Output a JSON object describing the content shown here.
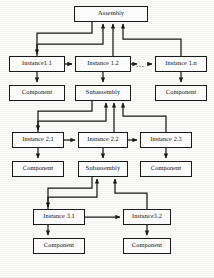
{
  "diagram": {
    "type": "block-hierarchy",
    "style": {
      "line_color": "#1a1a1a",
      "box_fill": "#ffffff",
      "text_color": "#0d0d0d",
      "background": "#fbfbfa"
    },
    "ellipsis_label": "...",
    "nodes": [
      {
        "id": "assembly",
        "label": "Assembly",
        "x": 74,
        "y": 6,
        "w": 74,
        "h": 16
      },
      {
        "id": "instance-1-1",
        "label": "Instance1.1",
        "x": 9,
        "y": 56,
        "w": 56,
        "h": 16
      },
      {
        "id": "instance-1-2",
        "label": "Instance 1.2",
        "x": 75,
        "y": 56,
        "w": 56,
        "h": 16
      },
      {
        "id": "instance-1-n",
        "label": "Instance 1.n",
        "x": 155,
        "y": 56,
        "w": 52,
        "h": 16
      },
      {
        "id": "component-1-1",
        "label": "Component",
        "x": 9,
        "y": 85,
        "w": 56,
        "h": 16
      },
      {
        "id": "subassembly-1",
        "label": "Subassembly",
        "x": 75,
        "y": 85,
        "w": 56,
        "h": 16
      },
      {
        "id": "component-1-n",
        "label": "Component",
        "x": 155,
        "y": 85,
        "w": 52,
        "h": 16
      },
      {
        "id": "instance-2-1",
        "label": "Instance 2.1",
        "x": 12,
        "y": 132,
        "w": 52,
        "h": 16
      },
      {
        "id": "instance-2-2",
        "label": "Instance 2.2",
        "x": 78,
        "y": 132,
        "w": 50,
        "h": 16
      },
      {
        "id": "instance-2-3",
        "label": "Instance 2.3",
        "x": 140,
        "y": 132,
        "w": 52,
        "h": 16
      },
      {
        "id": "component-2-1",
        "label": "Component",
        "x": 12,
        "y": 161,
        "w": 52,
        "h": 16
      },
      {
        "id": "subassembly-2",
        "label": "Subassembly",
        "x": 78,
        "y": 161,
        "w": 50,
        "h": 16
      },
      {
        "id": "component-2-3",
        "label": "Component",
        "x": 140,
        "y": 161,
        "w": 52,
        "h": 16
      },
      {
        "id": "instance-3-1",
        "label": "Instance 3.1",
        "x": 33,
        "y": 209,
        "w": 52,
        "h": 16
      },
      {
        "id": "instance-3-2",
        "label": "Instance3.2",
        "x": 123,
        "y": 209,
        "w": 48,
        "h": 16
      },
      {
        "id": "component-3-1",
        "label": "Component",
        "x": 33,
        "y": 238,
        "w": 52,
        "h": 16
      },
      {
        "id": "component-3-2",
        "label": "Component",
        "x": 123,
        "y": 238,
        "w": 48,
        "h": 16
      }
    ],
    "edges": [
      {
        "from": "assembly",
        "to": "instance-1-1",
        "kind": "elbow-down-left"
      },
      {
        "from": "assembly",
        "to": "instance-1-1",
        "kind": "up-arrow"
      },
      {
        "from": "assembly",
        "to": "instance-1-2",
        "kind": "up-arrow"
      },
      {
        "from": "assembly",
        "to": "instance-1-n",
        "kind": "up-arrow"
      },
      {
        "from": "instance-1-1",
        "to": "instance-1-2",
        "kind": "right-arrow"
      },
      {
        "from": "instance-1-2",
        "to": "ellipsis",
        "kind": "right-arrow"
      },
      {
        "from": "ellipsis",
        "to": "instance-1-n",
        "kind": "right-arrow"
      },
      {
        "from": "instance-1-1",
        "to": "component-1-1",
        "kind": "down-arrow"
      },
      {
        "from": "instance-1-2",
        "to": "subassembly-1",
        "kind": "down-arrow"
      },
      {
        "from": "instance-1-n",
        "to": "component-1-n",
        "kind": "down-arrow"
      },
      {
        "from": "subassembly-1",
        "to": "instance-2-1",
        "kind": "elbow-down-left"
      },
      {
        "from": "instance-2-1",
        "to": "subassembly-1",
        "kind": "up-arrow"
      },
      {
        "from": "instance-2-2",
        "to": "subassembly-1",
        "kind": "up-arrow"
      },
      {
        "from": "instance-2-3",
        "to": "subassembly-1",
        "kind": "up-arrow"
      },
      {
        "from": "instance-2-1",
        "to": "instance-2-2",
        "kind": "right-arrow"
      },
      {
        "from": "instance-2-2",
        "to": "instance-2-3",
        "kind": "right-arrow"
      },
      {
        "from": "instance-2-1",
        "to": "component-2-1",
        "kind": "down-arrow"
      },
      {
        "from": "instance-2-2",
        "to": "subassembly-2",
        "kind": "down-arrow"
      },
      {
        "from": "instance-2-3",
        "to": "component-2-3",
        "kind": "down-arrow"
      },
      {
        "from": "subassembly-2",
        "to": "instance-3-1",
        "kind": "elbow-down-left"
      },
      {
        "from": "instance-3-1",
        "to": "subassembly-2",
        "kind": "up-arrow"
      },
      {
        "from": "instance-3-2",
        "to": "subassembly-2",
        "kind": "up-arrow"
      },
      {
        "from": "instance-3-1",
        "to": "instance-3-2",
        "kind": "right-arrow"
      },
      {
        "from": "instance-3-1",
        "to": "component-3-1",
        "kind": "down-arrow"
      },
      {
        "from": "instance-3-2",
        "to": "component-3-2",
        "kind": "down-arrow"
      }
    ]
  }
}
